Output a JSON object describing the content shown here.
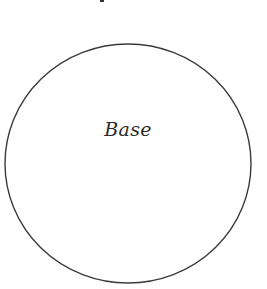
{
  "diagram": {
    "shape": "circle",
    "label": "Base",
    "stroke_color": "#3a3a3a",
    "fill_color": "#ffffff",
    "center": [
      128,
      163
    ],
    "radius": [
      123,
      120
    ]
  }
}
